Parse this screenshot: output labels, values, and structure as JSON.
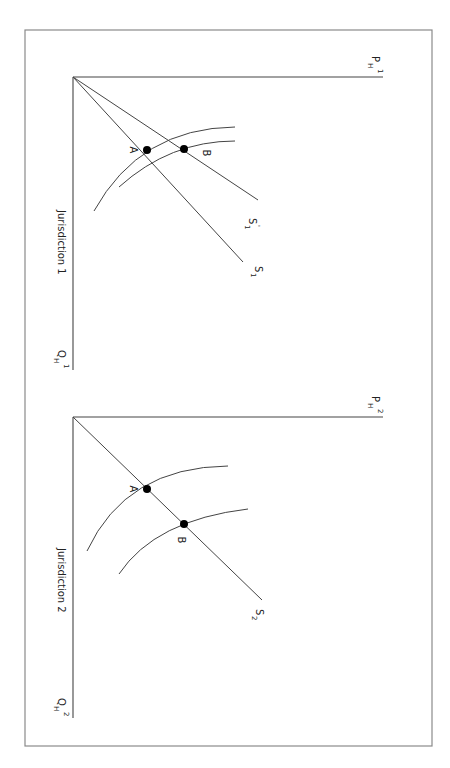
{
  "figure": {
    "orientation": "rotated 90 degrees clockwise",
    "panels": [
      {
        "id": "jurisdiction-1",
        "title": "Jurisdiction 1",
        "axis_price_label": {
          "base": "P",
          "sub": "H",
          "sup": "1"
        },
        "axis_quantity_label": {
          "base": "Q",
          "sub": "H",
          "sup": "1"
        },
        "rays": [
          {
            "name": "S1",
            "label": {
              "base": "S",
              "sub": "1",
              "sup": ""
            }
          },
          {
            "name": "S1-prime",
            "label": {
              "base": "S",
              "sub": "1",
              "sup": "'"
            }
          }
        ],
        "points": [
          {
            "name": "A",
            "label": "A"
          },
          {
            "name": "B",
            "label": "B"
          }
        ]
      },
      {
        "id": "jurisdiction-2",
        "title": "Jurisdiction 2",
        "axis_price_label": {
          "base": "P",
          "sub": "H",
          "sup": "2"
        },
        "axis_quantity_label": {
          "base": "Q",
          "sub": "H",
          "sup": "2"
        },
        "rays": [
          {
            "name": "S2",
            "label": {
              "base": "S",
              "sub": "2",
              "sup": ""
            }
          }
        ],
        "points": [
          {
            "name": "A",
            "label": "A"
          },
          {
            "name": "B",
            "label": "B"
          }
        ]
      }
    ]
  }
}
